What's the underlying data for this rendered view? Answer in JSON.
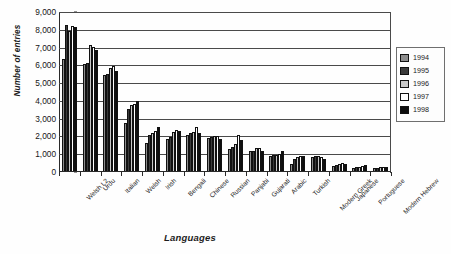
{
  "chart_data": {
    "type": "bar",
    "title": "",
    "xlabel": "Languages",
    "ylabel": "Number of entries",
    "ylim": [
      0,
      9000
    ],
    "ytick_values": [
      9000,
      8000,
      7000,
      6000,
      5000,
      4000,
      3000,
      2000,
      1000,
      0
    ],
    "ytick_labels": [
      "9,000",
      "8,000",
      "7,000",
      "6,000",
      "5,000",
      "4,000",
      "3,000",
      "2,000",
      "1,000",
      "0"
    ],
    "grid": true,
    "legend_position": "right",
    "categories": [
      "Welsh L2",
      "Urdu",
      "Italian",
      "Welsh",
      "Irish",
      "Bengali",
      "Chinese",
      "Russian",
      "Panjabi",
      "Gujarati",
      "Arabic",
      "Turkish",
      "Modern Greek",
      "Japanese",
      "Portuguese",
      "Modern Hebrew"
    ],
    "series": [
      {
        "name": "1994",
        "color": "#8d8d8d",
        "values": [
          6300,
          6000,
          5400,
          2700,
          1600,
          1800,
          2050,
          1850,
          1250,
          1100,
          850,
          400,
          800,
          300,
          180,
          150
        ]
      },
      {
        "name": "1995",
        "color": "#3a3a3a",
        "values": [
          8200,
          6100,
          5450,
          3500,
          2050,
          1900,
          2150,
          1900,
          1350,
          1150,
          880,
          700,
          820,
          330,
          200,
          180
        ]
      },
      {
        "name": "1996",
        "color": "#c8c8c8",
        "values": [
          7850,
          7100,
          5800,
          3700,
          2150,
          2200,
          2200,
          1950,
          1500,
          1300,
          900,
          800,
          850,
          400,
          250,
          200
        ]
      },
      {
        "name": "1997",
        "color": "#ffffff",
        "values": [
          8150,
          6950,
          5900,
          3750,
          2250,
          2300,
          2450,
          1950,
          2050,
          1320,
          950,
          830,
          800,
          430,
          260,
          210
        ]
      },
      {
        "name": "1998",
        "color": "#0d0d0d",
        "values": [
          8100,
          6800,
          5650,
          3950,
          2500,
          2250,
          2150,
          1800,
          1750,
          1150,
          1120,
          850,
          700,
          400,
          320,
          230
        ]
      }
    ]
  },
  "legend": {
    "items": [
      {
        "label": "1994",
        "color": "#8d8d8d"
      },
      {
        "label": "1995",
        "color": "#3a3a3a"
      },
      {
        "label": "1996",
        "color": "#c8c8c8"
      },
      {
        "label": "1997",
        "color": "#ffffff"
      },
      {
        "label": "1998",
        "color": "#0d0d0d"
      }
    ]
  }
}
